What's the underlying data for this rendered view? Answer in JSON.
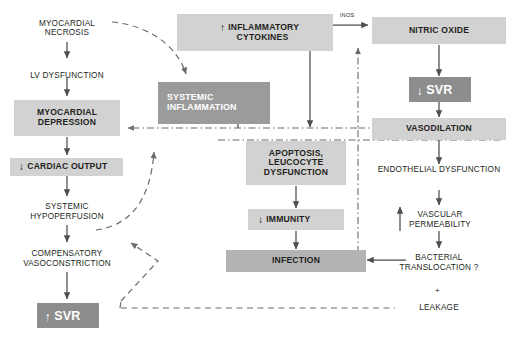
{
  "diagram": {
    "type": "flowchart",
    "colors": {
      "light_box": "#d2d2d2",
      "mid_box": "#b3b3b3",
      "dark_box": "#9b9b9b",
      "darker_box": "#8d8d8d",
      "text_dark": "#231f20",
      "text_light": "#ffffff",
      "arrow": "#4d4d4d",
      "background": "#ffffff"
    },
    "nodes": [
      {
        "id": "myocardial_necrosis",
        "label_line1": "MYOCARDIAL",
        "label_line2": "NECROSIS",
        "style": "plain"
      },
      {
        "id": "lv_dysfunction",
        "label_line1": "LV DYSFUNCTION",
        "label_line2": "",
        "style": "plain"
      },
      {
        "id": "myocardial_depression",
        "label_line1": "MYOCARDIAL",
        "label_line2": "DEPRESSION",
        "style": "light"
      },
      {
        "id": "cardiac_output",
        "label_line1": "CARDIAC OUTPUT",
        "label_line2": "",
        "style": "light",
        "arrow_glyph": "down"
      },
      {
        "id": "systemic_hypoperfusion",
        "label_line1": "SYSTEMIC",
        "label_line2": "HYPOPERFUSION",
        "style": "plain"
      },
      {
        "id": "compensatory_vasoconstriction",
        "label_line1": "COMPENSATORY",
        "label_line2": "VASOCONSTRICTION",
        "style": "plain"
      },
      {
        "id": "svr_up",
        "label_line1": "SVR",
        "label_line2": "",
        "style": "darker",
        "arrow_glyph": "up"
      },
      {
        "id": "inflammatory_cytokines",
        "label_line1": "INFLAMMATORY",
        "label_line2": "CYTOKINES",
        "style": "light",
        "arrow_glyph": "up"
      },
      {
        "id": "systemic_inflammation",
        "label_line1": "SYSTEMIC",
        "label_line2": "INFLAMMATION",
        "style": "dark"
      },
      {
        "id": "apoptosis_leucocyte",
        "label_line1": "APOPTOSIS,",
        "label_line2": "LEUCOCYTE",
        "label_line3": "DYSFUNCTION",
        "style": "light"
      },
      {
        "id": "immunity",
        "label_line1": "IMMUNITY",
        "label_line2": "",
        "style": "light",
        "arrow_glyph": "down"
      },
      {
        "id": "infection",
        "label_line1": "INFECTION",
        "label_line2": "",
        "style": "mid"
      },
      {
        "id": "nitric_oxide",
        "label_line1": "NITRIC OXIDE",
        "label_line2": "",
        "style": "light"
      },
      {
        "id": "svr_down",
        "label_line1": "SVR",
        "label_line2": "",
        "style": "darker",
        "arrow_glyph": "down"
      },
      {
        "id": "vasodilation",
        "label_line1": "VASODILATION",
        "label_line2": "",
        "style": "light"
      },
      {
        "id": "endothelial_dysfunction",
        "label_line1": "ENDOTHELIAL DYSFUNCTION",
        "label_line2": "",
        "style": "plain"
      },
      {
        "id": "vascular_permeability",
        "label_line1": "VASCULAR",
        "label_line2": "PERMEABILITY",
        "style": "plain",
        "arrow_glyph": "up"
      },
      {
        "id": "bacterial_translocation",
        "label_line1": "BACTERIAL",
        "label_line2": "TRANSLOCATION ?",
        "style": "plain"
      },
      {
        "id": "leakage",
        "label_line1": "LEAKAGE",
        "label_line2": "",
        "style": "plain"
      }
    ],
    "edge_labels": {
      "inos": "iNOS",
      "plus": "+"
    },
    "glyphs": {
      "up": "↑",
      "down": "↓"
    }
  }
}
